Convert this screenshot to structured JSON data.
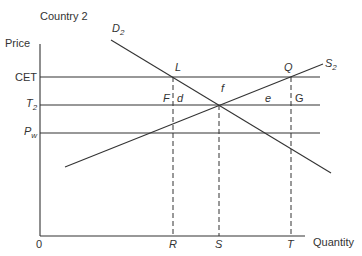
{
  "title": "Country 2",
  "axes": {
    "y_label": "Price",
    "x_label": "Quantity",
    "origin": "0"
  },
  "price_levels": [
    {
      "key": "CET",
      "label": "CET"
    },
    {
      "key": "T2",
      "label": "T",
      "sub": "2"
    },
    {
      "key": "Pw",
      "label": "P",
      "sub": "w"
    }
  ],
  "quantity_marks": [
    "R",
    "S",
    "T"
  ],
  "curves": {
    "demand": {
      "label": "D",
      "sub": "2"
    },
    "supply": {
      "label": "S",
      "sub": "2"
    }
  },
  "points": {
    "L": "L",
    "Q": "Q",
    "F": "F",
    "G": "G"
  },
  "areas": {
    "d": "d",
    "f": "f",
    "e": "e"
  },
  "line_color": "#333333"
}
